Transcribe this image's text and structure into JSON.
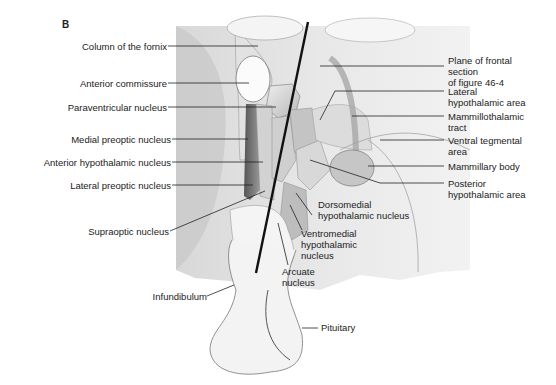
{
  "figure": {
    "panel_letter": "B",
    "left_labels": [
      {
        "text": "Column of the fornix"
      },
      {
        "text": "Anterior commissure"
      },
      {
        "text": "Paraventricular nucleus"
      },
      {
        "text": "Medial preoptic nucleus"
      },
      {
        "text": "Anterior hypothalamic nucleus"
      },
      {
        "text": "Lateral preoptic nucleus"
      },
      {
        "text": "Supraoptic nucleus"
      },
      {
        "text": "Infundibulum"
      }
    ],
    "right_labels": [
      {
        "lines": [
          "Plane of frontal",
          "section",
          "of figure 46-4"
        ]
      },
      {
        "lines": [
          "Lateral",
          "hypothalamic area"
        ]
      },
      {
        "lines": [
          "Mammillothalamic",
          "tract"
        ]
      },
      {
        "lines": [
          "Ventral tegmental",
          "area"
        ]
      },
      {
        "lines": [
          "Mammillary body"
        ]
      },
      {
        "lines": [
          "Posterior",
          "hypothalamic area"
        ]
      }
    ],
    "bottom_labels": [
      {
        "lines": [
          "Dorsomedial",
          "hypothalamic nucleus"
        ]
      },
      {
        "lines": [
          "Ventromedial",
          "hypothalamic",
          "nucleus"
        ]
      },
      {
        "lines": [
          "Arcuate",
          "nucleus"
        ]
      },
      {
        "lines": [
          "Pituitary"
        ]
      }
    ]
  }
}
